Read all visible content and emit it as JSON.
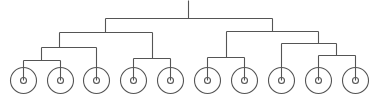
{
  "diagram": {
    "type": "dendrogram",
    "stroke_color": "#555555",
    "background": "#ffffff",
    "leaf_count": 10,
    "leaf_style": "concentric-circles",
    "leaf_outer_radius": 13,
    "leaf_inner_radius": 3,
    "leaf_center_y": 80,
    "root": {
      "x": 188,
      "y_top": 0,
      "y_join": 18
    },
    "edges": [
      {
        "x1": 188,
        "y1": 0,
        "x2": 188,
        "y2": 18
      },
      {
        "x1": 105,
        "y1": 18,
        "x2": 272,
        "y2": 18
      },
      {
        "x1": 105,
        "y1": 18,
        "x2": 105,
        "y2": 32
      },
      {
        "x1": 59,
        "y1": 32,
        "x2": 152,
        "y2": 32
      },
      {
        "x1": 59,
        "y1": 32,
        "x2": 59,
        "y2": 47
      },
      {
        "x1": 41,
        "y1": 47,
        "x2": 96,
        "y2": 47
      },
      {
        "x1": 41,
        "y1": 47,
        "x2": 41,
        "y2": 60
      },
      {
        "x1": 23,
        "y1": 60,
        "x2": 60,
        "y2": 60
      },
      {
        "x1": 23,
        "y1": 60,
        "x2": 23,
        "y2": 80
      },
      {
        "x1": 60,
        "y1": 60,
        "x2": 60,
        "y2": 80
      },
      {
        "x1": 96,
        "y1": 47,
        "x2": 96,
        "y2": 80
      },
      {
        "x1": 152,
        "y1": 32,
        "x2": 152,
        "y2": 58
      },
      {
        "x1": 133,
        "y1": 58,
        "x2": 170,
        "y2": 58
      },
      {
        "x1": 133,
        "y1": 58,
        "x2": 133,
        "y2": 80
      },
      {
        "x1": 170,
        "y1": 58,
        "x2": 170,
        "y2": 80
      },
      {
        "x1": 272,
        "y1": 18,
        "x2": 272,
        "y2": 31
      },
      {
        "x1": 226,
        "y1": 31,
        "x2": 318,
        "y2": 31
      },
      {
        "x1": 226,
        "y1": 31,
        "x2": 226,
        "y2": 57
      },
      {
        "x1": 207,
        "y1": 57,
        "x2": 244,
        "y2": 57
      },
      {
        "x1": 207,
        "y1": 57,
        "x2": 207,
        "y2": 80
      },
      {
        "x1": 244,
        "y1": 57,
        "x2": 244,
        "y2": 80
      },
      {
        "x1": 318,
        "y1": 31,
        "x2": 318,
        "y2": 43
      },
      {
        "x1": 281,
        "y1": 43,
        "x2": 336,
        "y2": 43
      },
      {
        "x1": 281,
        "y1": 43,
        "x2": 281,
        "y2": 80
      },
      {
        "x1": 336,
        "y1": 43,
        "x2": 336,
        "y2": 55
      },
      {
        "x1": 318,
        "y1": 55,
        "x2": 355,
        "y2": 55
      },
      {
        "x1": 318,
        "y1": 55,
        "x2": 318,
        "y2": 80
      },
      {
        "x1": 355,
        "y1": 55,
        "x2": 355,
        "y2": 80
      }
    ],
    "leaves": [
      {
        "x": 23
      },
      {
        "x": 60
      },
      {
        "x": 96
      },
      {
        "x": 133
      },
      {
        "x": 170
      },
      {
        "x": 207
      },
      {
        "x": 244
      },
      {
        "x": 281
      },
      {
        "x": 318
      },
      {
        "x": 355
      }
    ]
  }
}
